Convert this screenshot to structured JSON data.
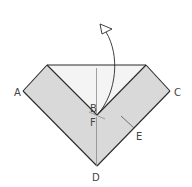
{
  "diagram": {
    "type": "origami-fold-step",
    "labels": {
      "A": "A",
      "B": "B",
      "C": "C",
      "D": "D",
      "E": "E",
      "F": "F"
    },
    "colors": {
      "paper_gray": "#d9d9d9",
      "paper_light": "#f4f4f4",
      "stroke": "#2a2a2a",
      "crease": "#8a8a8a",
      "background": "#ffffff"
    },
    "arrow": {
      "direction": "up",
      "style": "hollow-head",
      "meaning": "fold-back"
    }
  }
}
